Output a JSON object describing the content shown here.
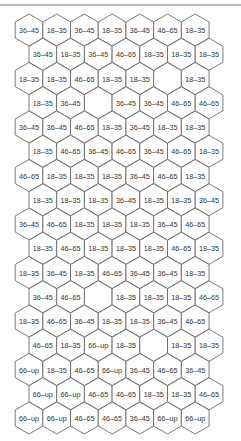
{
  "diagram": {
    "type": "hexagon-grid",
    "colors": {
      "outline": "#6a6a6a",
      "text": "#333333",
      "fill": "#ffffff",
      "top_rule": "#b8b8b8"
    },
    "columns": 7,
    "rows": [
      [
        "36–45",
        "18–35",
        "36–45",
        "18–35",
        "36–45",
        "46–65",
        "18–35"
      ],
      [
        "36–45",
        "18–35",
        "36–45",
        "46–65",
        "18–35",
        "18–35",
        "18–35"
      ],
      [
        "18–35",
        "18–35",
        "46–65",
        "18–35",
        "18–35",
        "",
        "18–35"
      ],
      [
        "18–35",
        "36–45",
        "",
        "36–45",
        "36–45",
        "46–65",
        "46–65"
      ],
      [
        "36–45",
        "36–45",
        "46–65",
        "18–35",
        "36–45",
        "18–35",
        "18–35"
      ],
      [
        "18–35",
        "46–65",
        "36–45",
        "46–65",
        "36–45",
        "46–65",
        "18–35"
      ],
      [
        "46–65",
        "18–35",
        "18–35",
        "18–35",
        "36–45",
        "46–65",
        "18–35"
      ],
      [
        "18–35",
        "18–35",
        "18–35",
        "36–45",
        "18–35",
        "18–35",
        "36–45"
      ],
      [
        "36–45",
        "46–65",
        "18–35",
        "18–35",
        "18–35",
        "36–45",
        "46–65"
      ],
      [
        "18–35",
        "46–65",
        "18–35",
        "18–35",
        "18–35",
        "46–65",
        "18–35"
      ],
      [
        "18–35",
        "36–45",
        "18–35",
        "46–65",
        "36–45",
        "36–45",
        "18–35"
      ],
      [
        "36–45",
        "46–65",
        "",
        "18–35",
        "18–35",
        "18–35",
        "46–65"
      ],
      [
        "18–35",
        "46–65",
        "36–45",
        "18–35",
        "18–35",
        "36–45",
        "46–65"
      ],
      [
        "46–65",
        "18–35",
        "66–up",
        "18–35",
        "",
        "18–35",
        "18–35"
      ],
      [
        "66–up",
        "18–35",
        "46–65",
        "66–up",
        "36–45",
        "46–65",
        "36–45"
      ],
      [
        "66–up",
        "66–up",
        "46–65",
        "46–65",
        "18–35",
        "18–35",
        "46–65"
      ],
      [
        "66–up",
        "66–up",
        "46–65",
        "46–65",
        "36–45",
        "66–up",
        "66–up"
      ]
    ]
  }
}
